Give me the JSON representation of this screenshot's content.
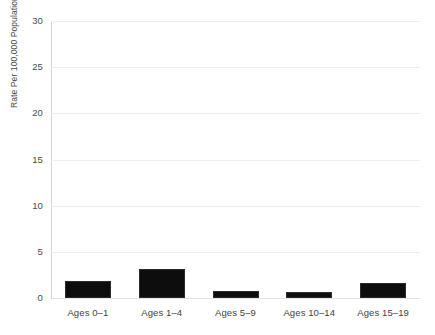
{
  "chart_data": {
    "type": "bar",
    "title": "",
    "subtitle": "",
    "xlabel": "",
    "ylabel": "Rate Per 100,000 Population",
    "categories": [
      "Ages 0–1",
      "Ages 1–4",
      "Ages 5–9",
      "Ages 10–14",
      "Ages 15–19"
    ],
    "values": [
      1.8,
      3.1,
      0.75,
      0.7,
      1.6
    ],
    "ylim": [
      0,
      30
    ],
    "ytick_labels": [
      "30",
      "25",
      "20",
      "15",
      "10",
      "5",
      "0"
    ],
    "ytick_values": [
      30,
      25,
      20,
      15,
      10,
      5,
      0
    ],
    "grid": true,
    "grid_axis": "y",
    "legend": false,
    "legend_position": "none",
    "bar_color": "#0d0d0d",
    "grid_color": "#ededed",
    "axis_color": "#d4d4d4",
    "background_color": "#ffffff",
    "text_color": "#3f3f3f"
  },
  "axis": {
    "y_title": "Rate Per 100,000 Population"
  },
  "title_sliver": " "
}
